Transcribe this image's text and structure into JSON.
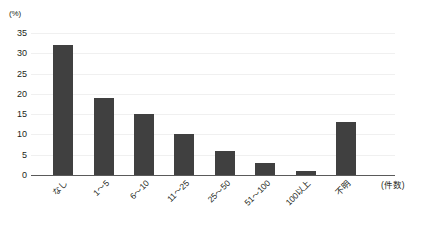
{
  "chart_data": {
    "type": "bar",
    "title": "",
    "subtitle": "",
    "xlabel": "(件数)",
    "ylabel": "(%)",
    "categories": [
      "なし",
      "1～5",
      "6～10",
      "11～25",
      "25～50",
      "51～100",
      "100以上",
      "不明"
    ],
    "values": [
      32,
      19,
      15,
      10,
      6,
      3,
      1,
      13
    ],
    "ylim": [
      0,
      35
    ],
    "ytick_labels": [
      "0",
      "5",
      "10",
      "15",
      "20",
      "25",
      "30",
      "35"
    ],
    "ytick_values": [
      0,
      5,
      10,
      15,
      20,
      25,
      30,
      35
    ],
    "grid": true,
    "legend": false,
    "bar_color": "#404040",
    "grid_color": "#f0f0f0",
    "axis_color": "#5a5a5a",
    "background": "#ffffff"
  }
}
